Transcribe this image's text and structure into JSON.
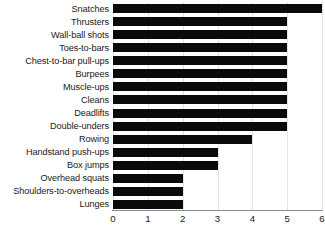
{
  "chart_data": {
    "type": "bar",
    "orientation": "horizontal",
    "title": "",
    "subtitle": "",
    "xlabel": "",
    "ylabel": "",
    "xlim": [
      0,
      6
    ],
    "xticks": [
      0,
      1,
      2,
      3,
      4,
      5,
      6
    ],
    "xtick_labels": [
      "0",
      "1",
      "2",
      "3",
      "4",
      "5",
      "6"
    ],
    "grid": true,
    "grid_axis": "x",
    "legend": false,
    "bar_color": "#0a0a0a",
    "grid_color": "#e3e3e3",
    "axis_color": "#8a8a8a",
    "background": "#ffffff",
    "categories": [
      "Snatches",
      "Thrusters",
      "Wall-ball shots",
      "Toes-to-bars",
      "Chest-to-bar pull-ups",
      "Burpees",
      "Muscle-ups",
      "Cleans",
      "Deadlifts",
      "Double-unders",
      "Rowing",
      "Handstand push-ups",
      "Box jumps",
      "Overhead squats",
      "Shoulders-to-overheads",
      "Lunges"
    ],
    "values": [
      6,
      5,
      5,
      5,
      5,
      5,
      5,
      5,
      5,
      5,
      4,
      3,
      3,
      2,
      2,
      2
    ]
  }
}
